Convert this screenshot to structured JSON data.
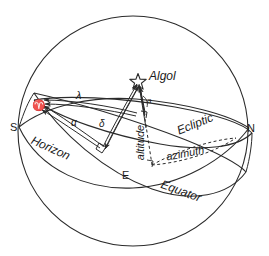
{
  "diagram": {
    "stroke_color": "#2b2b2b",
    "background": "#ffffff",
    "sphere": {
      "center_x": 133,
      "center_y": 131,
      "radius": 115
    }
  },
  "labels": {
    "star_name": "Algol",
    "vernal_point": "♈",
    "ecliptic_longitude": "λ",
    "right_ascension": "α",
    "declination": "δ",
    "altitude_angle": "a",
    "altitude": "altitude",
    "azimuth": "azimuth",
    "ecliptic": "Ecliptic",
    "equator": "Equator",
    "horizon": "Horizon",
    "south": "S",
    "east": "E",
    "north": "N",
    "star_glyph": "star-icon"
  }
}
